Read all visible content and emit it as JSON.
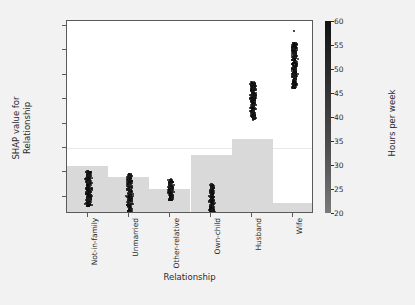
{
  "chart_data": {
    "type": "scatter",
    "title": "",
    "xlabel": "Relationship",
    "ylabel": "SHAP value for\nRelationship",
    "ylabel_line1": "SHAP value for",
    "ylabel_line2": "Relationship",
    "categories": [
      "Not-in-family",
      "Unmarried",
      "Other-relative",
      "Own-child",
      "Husband",
      "Wife"
    ],
    "ylim": [
      -1.35,
      2.6
    ],
    "yticks": [
      2.5,
      2.0,
      1.5,
      1.0,
      0.5,
      0.0,
      -0.5,
      -1.0
    ],
    "ytick_labels": [
      "2.5",
      "2.0",
      "1.5",
      "1.0",
      "0.5",
      "0.0",
      "−0.5",
      "−1.0"
    ],
    "grid": false,
    "zero_line": 0.0,
    "series": [
      {
        "name": "Not-in-family",
        "category_index": 0,
        "shap_center": -0.78,
        "shap_min": -1.18,
        "shap_max": -0.45,
        "count": 320
      },
      {
        "name": "Unmarried",
        "category_index": 1,
        "shap_center": -0.83,
        "shap_min": -1.28,
        "shap_max": -0.5,
        "count": 260
      },
      {
        "name": "Other-relative",
        "category_index": 2,
        "shap_center": -0.86,
        "shap_min": -1.05,
        "shap_max": -0.62,
        "count": 150
      },
      {
        "name": "Own-child",
        "category_index": 3,
        "shap_center": -0.92,
        "shap_min": -1.3,
        "shap_max": -0.72,
        "count": 210
      },
      {
        "name": "Husband",
        "category_index": 4,
        "shap_center": 1.12,
        "shap_min": 0.6,
        "shap_max": 1.38,
        "count": 300
      },
      {
        "name": "Wife",
        "category_index": 5,
        "shap_center": 1.78,
        "shap_min": 1.24,
        "shap_max": 2.18,
        "count": 340,
        "outlier": 2.42
      }
    ],
    "histogram": {
      "name": "count density bars",
      "color": "#d9d9d9",
      "values": [
        0.26,
        0.2,
        0.13,
        0.33,
        0.4,
        0.05
      ],
      "bar_heights_px": [
        46,
        35,
        23,
        57,
        73,
        9
      ]
    },
    "colorbar": {
      "label": "Hours per week",
      "min": 20,
      "max": 60,
      "ticks": [
        60,
        55,
        50,
        45,
        40,
        35,
        30,
        25,
        20
      ],
      "tick_labels": [
        "60",
        "55",
        "50",
        "45",
        "40",
        "35",
        "30",
        "25",
        "20"
      ],
      "orientation": "vertical",
      "position": "right",
      "gradient_top_color": "#111111",
      "gradient_bottom_color": "#7a7a7a"
    },
    "point_color": "#111111",
    "background_color": "#ffffff",
    "figure_background_color": "#f2f2f2"
  }
}
